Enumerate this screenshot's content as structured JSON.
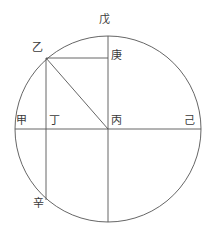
{
  "figure": {
    "type": "geometric-circle-diagram",
    "background_color": "#ffffff",
    "stroke_color": "#555555",
    "label_color": "#3a3a3a",
    "stroke_width": 0.9,
    "canvas": {
      "width": 214,
      "height": 242
    },
    "circle": {
      "cx": 108,
      "cy": 129,
      "r": 93
    },
    "points": {
      "wu": {
        "label": "戊",
        "x": 108,
        "y": 36,
        "desc": "top-of-circle"
      },
      "yi": {
        "label": "乙",
        "x": 46,
        "y": 58,
        "desc": "upper-left-arc-point"
      },
      "geng": {
        "label": "庚",
        "x": 108,
        "y": 58,
        "desc": "on-vertical-diameter"
      },
      "jia": {
        "label": "甲",
        "x": 15,
        "y": 129,
        "desc": "left-of-circle"
      },
      "ding": {
        "label": "丁",
        "x": 46,
        "y": 129,
        "desc": "chord-crosses-diameter"
      },
      "bing": {
        "label": "丙",
        "x": 108,
        "y": 129,
        "desc": "center"
      },
      "ji": {
        "label": "己",
        "x": 201,
        "y": 129,
        "desc": "right-of-circle"
      },
      "xin": {
        "label": "辛",
        "x": 46,
        "y": 200,
        "desc": "lower-left-arc-point"
      }
    },
    "segments": [
      {
        "name": "horizontal-diameter",
        "from": "jia",
        "to": "ji"
      },
      {
        "name": "vertical-diameter",
        "from": "wu",
        "to": "bottom"
      },
      {
        "name": "segment-yi-geng",
        "from": "yi",
        "to": "geng"
      },
      {
        "name": "chord-yi-xin",
        "from": "yi",
        "to": "xin"
      },
      {
        "name": "radius-yi-bing",
        "from": "yi",
        "to": "bing"
      }
    ],
    "labels": {
      "wu": "戊",
      "yi": "乙",
      "geng": "庚",
      "jia": "甲",
      "ding": "丁",
      "bing": "丙",
      "ji": "己",
      "xin": "辛"
    }
  }
}
